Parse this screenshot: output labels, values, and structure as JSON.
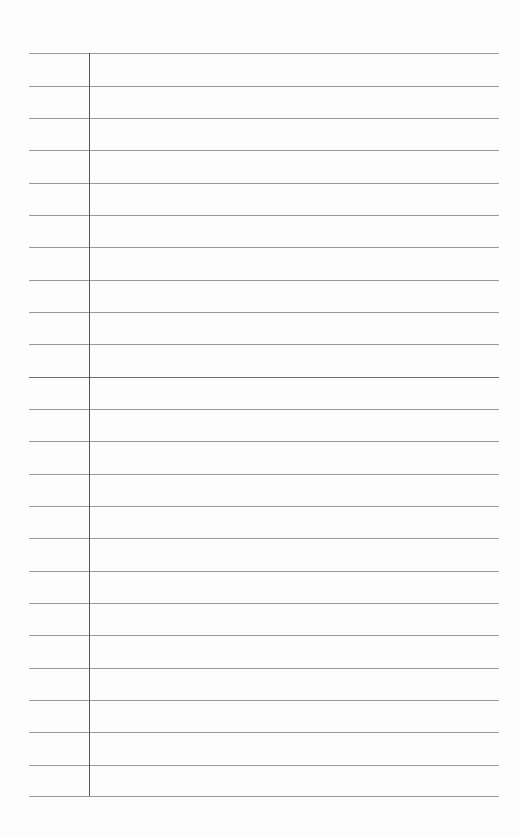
{
  "page": {
    "type": "lined-notebook-paper",
    "background_color": "#fdfdfd",
    "rule_color": "#9a9a9a",
    "margin_line_color": "#555555",
    "rules_top": [
      53,
      86,
      118,
      150,
      183,
      215,
      247,
      280,
      312,
      344,
      377,
      409,
      441,
      474,
      506,
      538,
      571,
      603,
      635,
      668,
      700,
      732,
      765,
      796
    ],
    "dark_rule_index": 10,
    "rule_left": 29,
    "rule_right": 499,
    "margin_x": 89
  }
}
